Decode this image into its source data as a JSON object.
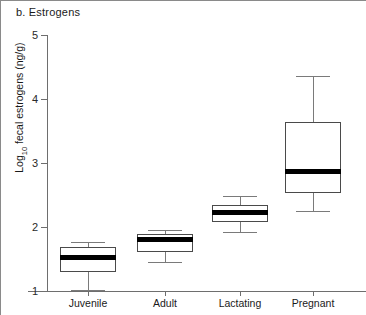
{
  "figure": {
    "panel_label": "b. Estrogens"
  },
  "chart_data": {
    "type": "box",
    "title": "b. Estrogens",
    "xlabel": "",
    "ylabel": "Log10 fecal estrogens (ng/g)",
    "ylabel_parts": {
      "prefix": "Log",
      "subscript": "10",
      "suffix": " fecal estrogens (ng/g)"
    },
    "ylim": [
      1,
      5
    ],
    "yticks": [
      1,
      2,
      3,
      4,
      5
    ],
    "ytick_labels": [
      "1",
      "2",
      "3",
      "4",
      "5"
    ],
    "grid": false,
    "legend": null,
    "categories": [
      "Juvenile",
      "Adult",
      "Lactating",
      "Pregnant"
    ],
    "boxes": [
      {
        "category": "Juvenile",
        "whisker_low": 1.02,
        "q1": 1.3,
        "median": 1.53,
        "q3": 1.68,
        "whisker_high": 1.77
      },
      {
        "category": "Adult",
        "whisker_low": 1.45,
        "q1": 1.61,
        "median": 1.8,
        "q3": 1.89,
        "whisker_high": 1.95
      },
      {
        "category": "Lactating",
        "whisker_low": 1.92,
        "q1": 2.08,
        "median": 2.22,
        "q3": 2.34,
        "whisker_high": 2.48
      },
      {
        "category": "Pregnant",
        "whisker_low": 2.25,
        "q1": 2.53,
        "median": 2.87,
        "q3": 3.64,
        "whisker_high": 4.36
      }
    ]
  }
}
